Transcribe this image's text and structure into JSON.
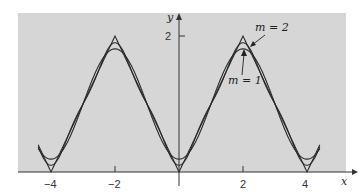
{
  "chart_data": {
    "type": "line",
    "title": "",
    "xlabel": "x",
    "ylabel": "y",
    "xlim": [
      -4.4,
      5.2
    ],
    "ylim": [
      0,
      2.2
    ],
    "x_ticks": [
      -4,
      -2,
      0,
      2,
      4
    ],
    "x_tick_labels": [
      "-4",
      "-2",
      "",
      "2",
      "4"
    ],
    "y_ticks": [
      2
    ],
    "y_tick_labels": [
      "2"
    ],
    "grid": false,
    "background": "#d4d4d4",
    "series": [
      {
        "name": "f(x) = |x| (periodic triangle wave, period 4)",
        "x": [
          -4.4,
          -4,
          -2,
          0,
          2,
          4,
          4.4
        ],
        "values": [
          0.4,
          0,
          2,
          0,
          2,
          0,
          0.4
        ]
      },
      {
        "name": "m = 1",
        "formula": "1 - (8/pi^2) cos(pi x / 2)",
        "peak_at_x=±2": 1.81,
        "min_at_x=0,±4": 0.19
      },
      {
        "name": "m = 2",
        "formula": "1 - (8/pi^2)[cos(pi x/2) + cos(3 pi x/2)/9]",
        "peak_at_x=±2": 1.9,
        "min_at_x=0,±4": 0.1
      }
    ],
    "annotations": [
      {
        "text": "m = 2",
        "points_to": [
          2.3,
          1.87
        ]
      },
      {
        "text": "m = 1",
        "points_to": [
          2.0,
          1.81
        ]
      }
    ]
  },
  "labels": {
    "x_axis": "x",
    "y_axis": "y",
    "y_tick_2": "2",
    "x_tick_m4": "−4",
    "x_tick_m2": "−2",
    "x_tick_2": "2",
    "x_tick_4": "4",
    "annot_m2": "m = 2",
    "annot_m1": "m = 1"
  }
}
